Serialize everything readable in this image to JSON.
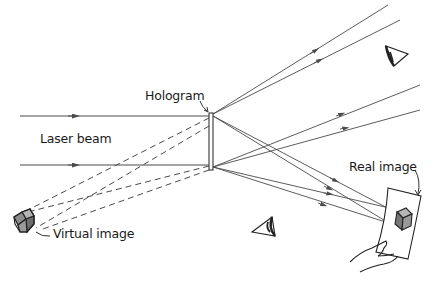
{
  "labels": {
    "hologram": "Hologram",
    "laser_beam": "Laser beam",
    "virtual_image": "Virtual image",
    "real_image": "Real image"
  },
  "colors": {
    "line": "#4a4a4a",
    "text": "#1a1a1a",
    "cube_face": "#8c8c8c",
    "cube_top": "#b5b5b5",
    "background": "#ffffff"
  },
  "elements": {
    "laser_beams": 2,
    "diverging_rays": 4,
    "converging_rays": 4,
    "virtual_rays_dashed": 4,
    "eyes": 2
  }
}
